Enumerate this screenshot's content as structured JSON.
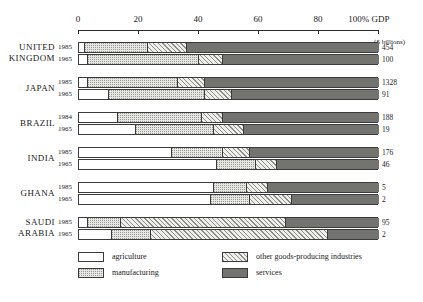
{
  "chart_data": {
    "type": "bar",
    "subtype": "stacked-horizontal-100pct",
    "title": "",
    "xlabel": "100% GDP",
    "ylabel": "",
    "unit_note": "($ billions)",
    "xlim": [
      0,
      100
    ],
    "grid": false,
    "axis": {
      "ticks": [
        0,
        20,
        40,
        60,
        80,
        100
      ],
      "tick_labels": [
        "0",
        "20",
        "40",
        "60",
        "80",
        "100% GDP"
      ]
    },
    "legend": {
      "position": "bottom",
      "entries": [
        {
          "key": "agriculture",
          "label": "agriculture",
          "fill": "#ffffff"
        },
        {
          "key": "manufacturing",
          "label": "manufacturing",
          "fill": "#e6e6e2"
        },
        {
          "key": "other",
          "label": "other goods-producing industries",
          "fill": "#eeeeea"
        },
        {
          "key": "services",
          "label": "services",
          "fill": "#737370"
        }
      ]
    },
    "series": [
      {
        "name": "agriculture",
        "label": "agriculture"
      },
      {
        "name": "manufacturing",
        "label": "manufacturing"
      },
      {
        "name": "other",
        "label": "other goods-producing industries"
      },
      {
        "name": "services",
        "label": "services"
      }
    ],
    "groups": [
      {
        "country": "UNITED KINGDOM",
        "country_lines": [
          "UNITED",
          "KINGDOM"
        ],
        "rows": [
          {
            "year": "1985",
            "gdp": "454",
            "total_pct": 100,
            "values": {
              "agriculture": 2,
              "manufacturing": 21,
              "other": 13,
              "services": 64
            }
          },
          {
            "year": "1965",
            "gdp": "100",
            "total_pct": 100,
            "values": {
              "agriculture": 3,
              "manufacturing": 37,
              "other": 8,
              "services": 52
            }
          }
        ]
      },
      {
        "country": "JAPAN",
        "country_lines": [
          "JAPAN"
        ],
        "rows": [
          {
            "year": "1985",
            "gdp": "1328",
            "total_pct": 100,
            "values": {
              "agriculture": 3,
              "manufacturing": 30,
              "other": 9,
              "services": 58
            }
          },
          {
            "year": "1965",
            "gdp": "91",
            "total_pct": 100,
            "values": {
              "agriculture": 10,
              "manufacturing": 32,
              "other": 9,
              "services": 49
            }
          }
        ]
      },
      {
        "country": "BRAZIL",
        "country_lines": [
          "BRAZIL"
        ],
        "rows": [
          {
            "year": "1984",
            "gdp": "188",
            "total_pct": 100,
            "values": {
              "agriculture": 13,
              "manufacturing": 28,
              "other": 7,
              "services": 52
            }
          },
          {
            "year": "1965",
            "gdp": "19",
            "total_pct": 100,
            "values": {
              "agriculture": 19,
              "manufacturing": 26,
              "other": 10,
              "services": 45
            }
          }
        ]
      },
      {
        "country": "INDIA",
        "country_lines": [
          "INDIA"
        ],
        "rows": [
          {
            "year": "1985",
            "gdp": "176",
            "total_pct": 100,
            "values": {
              "agriculture": 31,
              "manufacturing": 17,
              "other": 9,
              "services": 43
            }
          },
          {
            "year": "1965",
            "gdp": "46",
            "total_pct": 100,
            "values": {
              "agriculture": 46,
              "manufacturing": 13,
              "other": 7,
              "services": 34
            }
          }
        ]
      },
      {
        "country": "GHANA",
        "country_lines": [
          "GHANA"
        ],
        "rows": [
          {
            "year": "1985",
            "gdp": "5",
            "total_pct": 100,
            "values": {
              "agriculture": 45,
              "manufacturing": 11,
              "other": 7,
              "services": 37
            }
          },
          {
            "year": "1965",
            "gdp": "2",
            "total_pct": 100,
            "values": {
              "agriculture": 44,
              "manufacturing": 13,
              "other": 14,
              "services": 29
            }
          }
        ]
      },
      {
        "country": "SAUDI ARABIA",
        "country_lines": [
          "SAUDI",
          "ARABIA"
        ],
        "rows": [
          {
            "year": "1985",
            "gdp": "95",
            "total_pct": 100,
            "values": {
              "agriculture": 3,
              "manufacturing": 11,
              "other": 55,
              "services": 31
            }
          },
          {
            "year": "1965",
            "gdp": "2",
            "total_pct": 100,
            "values": {
              "agriculture": 11,
              "manufacturing": 13,
              "other": 59,
              "services": 17
            }
          }
        ]
      }
    ]
  }
}
